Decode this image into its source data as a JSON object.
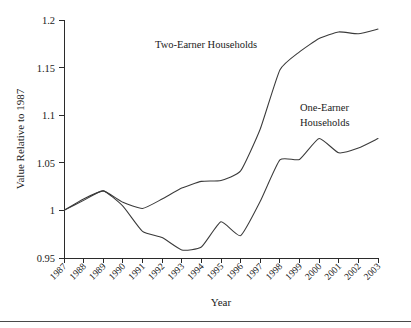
{
  "figure": {
    "background_color": "#ffffff",
    "line_color": "#3a3a3a",
    "axis_color": "#2b2b2b",
    "bottom_rule": true
  },
  "chart_data": {
    "type": "line",
    "title": "",
    "xlabel": "Year",
    "ylabel": "Value Relative to 1987",
    "xlim": [
      1987,
      2003
    ],
    "ylim": [
      0.95,
      1.2
    ],
    "yticks": [
      0.95,
      1,
      1.05,
      1.1,
      1.15,
      1.2
    ],
    "ytick_labels": [
      "0.95",
      "1",
      "1.05",
      "1.1",
      "1.15",
      "1.2"
    ],
    "x": [
      1987,
      1988,
      1989,
      1990,
      1991,
      1992,
      1993,
      1994,
      1995,
      1996,
      1997,
      1998,
      1999,
      2000,
      2001,
      2002,
      2003
    ],
    "xtick_labels": [
      "1987",
      "1988",
      "1989",
      "1990",
      "1991",
      "1992",
      "1993",
      "1994",
      "1995",
      "1996",
      "1997",
      "1998",
      "1999",
      "2000",
      "2001",
      "2002",
      "2003"
    ],
    "grid": false,
    "legend_position": "inline-annotations",
    "series": [
      {
        "name": "Two-Earner Households",
        "values": [
          1.0,
          1.012,
          1.0205,
          1.0085,
          1.002,
          1.012,
          1.0235,
          1.0305,
          1.0315,
          1.0415,
          1.0855,
          1.1475,
          1.1665,
          1.1805,
          1.1875,
          1.1855,
          1.1905
        ]
      },
      {
        "name": "One-Earner Households",
        "values": [
          1.0,
          1.0105,
          1.0205,
          1.0045,
          0.978,
          0.9715,
          0.9585,
          0.9615,
          0.988,
          0.9735,
          1.0095,
          1.053,
          1.0535,
          1.0755,
          1.0605,
          1.0655,
          1.0755
        ]
      }
    ],
    "annotations": [
      {
        "text": "Two-Earner Households",
        "x": 1992.4,
        "y": 1.1755
      },
      {
        "text_line1": "One-Earner",
        "text_line2": "Households",
        "x": 1999.5,
        "y": 1.116
      }
    ]
  }
}
